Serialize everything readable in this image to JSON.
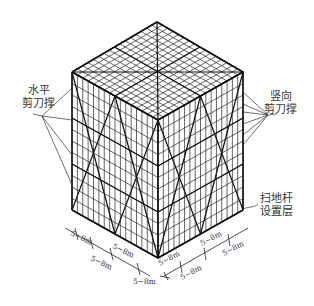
{
  "diagram": {
    "labels": {
      "horizontal_brace": {
        "line1": "水平",
        "line2": "剪刀撑"
      },
      "vertical_brace": {
        "line1": "竖向",
        "line2": "剪刀撑"
      },
      "sweep_rod_layer": {
        "line1": "扫地杆",
        "line2": "设置层"
      }
    },
    "dimensions": {
      "left_edge": [
        "5~8m",
        "5~8m",
        "5~8m",
        "5~8m"
      ],
      "right_edge": [
        "5~8m",
        "5~8m",
        "5~8m",
        "5~8m"
      ]
    },
    "colors": {
      "line": "#222222",
      "background": "#ffffff"
    }
  }
}
